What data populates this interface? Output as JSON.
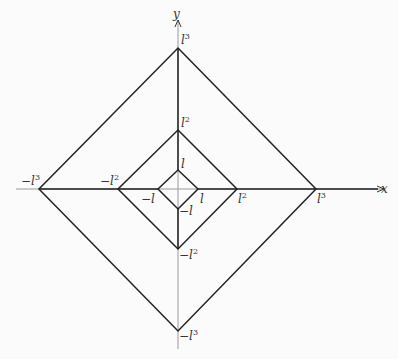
{
  "axes": {
    "x_label": "x",
    "y_label": "y",
    "origin_px": [
      178,
      189
    ],
    "axis_color": "#9a9a9a",
    "shape_color": "#222222"
  },
  "diamonds": [
    {
      "name": "l",
      "half_extent_px": 20,
      "labels": {
        "right": "l",
        "left": "−l",
        "top": "l",
        "bottom": "−l"
      }
    },
    {
      "name": "l2",
      "half_extent_px": 59,
      "labels": {
        "right": "l",
        "left": "−l",
        "top": "l",
        "bottom": "−l"
      },
      "exponent": "2"
    },
    {
      "name": "l3",
      "half_extent_px": 141,
      "labels": {
        "right": "l",
        "left": "−l",
        "top": "l",
        "bottom": "−l"
      },
      "exponent": "3"
    }
  ],
  "labels": {
    "pos_l": "l",
    "neg_l": "−l",
    "pos_l2": "l",
    "neg_l2": "−l",
    "pos_l3": "l",
    "neg_l3": "−l",
    "exp2": "2",
    "exp3": "3"
  }
}
